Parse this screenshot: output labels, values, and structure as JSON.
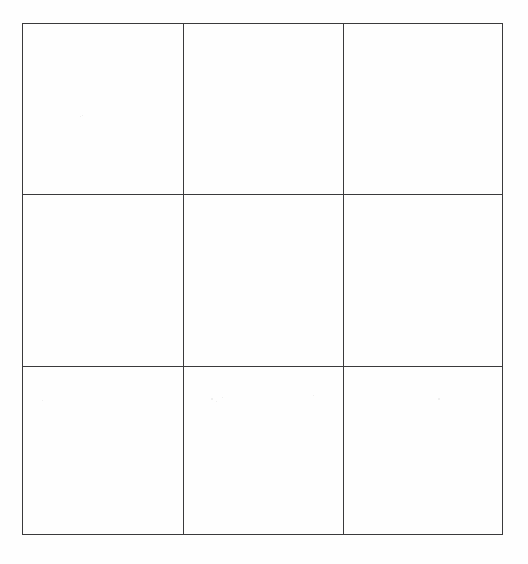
{
  "document": {
    "type": "scanned-page",
    "background_color": "#fefefe",
    "clipped_header_text": "",
    "note": ""
  },
  "grid": {
    "rows": 3,
    "columns": 3,
    "border_color": "#3a3a3c",
    "border_width_px": 1,
    "cells": [
      [
        {
          "text": ""
        },
        {
          "text": ""
        },
        {
          "text": ""
        }
      ],
      [
        {
          "text": ""
        },
        {
          "text": ""
        },
        {
          "text": ""
        }
      ],
      [
        {
          "text": ""
        },
        {
          "text": ""
        },
        {
          "text": ""
        }
      ]
    ]
  }
}
